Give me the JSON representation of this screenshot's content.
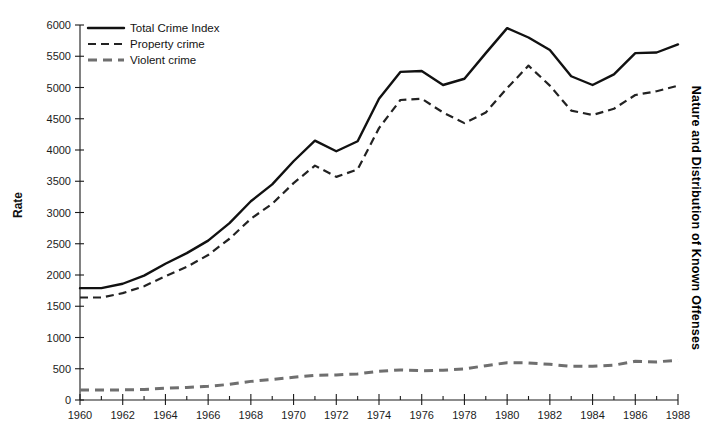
{
  "figure": {
    "side_title": "Nature and Distribution of Known Offenses",
    "cropped_top_title": ""
  },
  "chart_data": {
    "type": "line",
    "title": "",
    "xlabel": "",
    "ylabel": "Rate",
    "xlim": [
      1960,
      1988
    ],
    "ylim": [
      0,
      6000
    ],
    "y_ticks": [
      0,
      500,
      1000,
      1500,
      2000,
      2500,
      3000,
      3500,
      4000,
      4500,
      5000,
      5500,
      6000
    ],
    "y_tick_labels": [
      "0",
      "500",
      "1000",
      "1500",
      "2000",
      "2500",
      "3000",
      "3500",
      "4000",
      "4500",
      "5000",
      "5500",
      "6000"
    ],
    "x_ticks": [
      1960,
      1962,
      1964,
      1966,
      1968,
      1970,
      1972,
      1974,
      1976,
      1978,
      1980,
      1982,
      1984,
      1986,
      1988
    ],
    "x_tick_labels": [
      "1960",
      "1962",
      "1964",
      "1966",
      "1968",
      "1970",
      "1972",
      "1974",
      "1976",
      "1978",
      "1980",
      "1982",
      "1984",
      "1986",
      "1988"
    ],
    "x_minor_ticks": [
      1961,
      1963,
      1965,
      1967,
      1969,
      1971,
      1973,
      1975,
      1977,
      1979,
      1981,
      1983,
      1985,
      1987
    ],
    "grid": false,
    "legend_position": "top-left",
    "x": [
      1960,
      1961,
      1962,
      1963,
      1964,
      1965,
      1966,
      1967,
      1968,
      1969,
      1970,
      1971,
      1972,
      1973,
      1974,
      1975,
      1976,
      1977,
      1978,
      1979,
      1980,
      1981,
      1982,
      1983,
      1984,
      1985,
      1986,
      1987,
      1988
    ],
    "series": [
      {
        "name": "Total Crime Index",
        "style": "solid",
        "color": "#111111",
        "values": [
          1790,
          1790,
          1860,
          1990,
          2180,
          2350,
          2550,
          2830,
          3180,
          3450,
          3820,
          4150,
          3980,
          4140,
          4820,
          5250,
          5265,
          5040,
          5140,
          5550,
          5950,
          5800,
          5600,
          5180,
          5040,
          5210,
          5550,
          5560,
          5690
        ]
      },
      {
        "name": "Property crime",
        "style": "dashed",
        "color": "#222222",
        "values": [
          1640,
          1640,
          1710,
          1820,
          1980,
          2130,
          2320,
          2580,
          2900,
          3140,
          3470,
          3750,
          3570,
          3690,
          4350,
          4800,
          4820,
          4600,
          4430,
          4600,
          4990,
          5350,
          5030,
          4630,
          4560,
          4660,
          4880,
          4940,
          5030
        ]
      },
      {
        "name": "Violent crime",
        "style": "dashed-thick",
        "color": "#6f6f6f",
        "values": [
          160,
          160,
          162,
          168,
          190,
          200,
          220,
          250,
          298,
          328,
          364,
          396,
          401,
          417,
          461,
          482,
          468,
          476,
          498,
          549,
          597,
          594,
          571,
          538,
          539,
          557,
          620,
          610,
          637
        ]
      }
    ]
  },
  "legend": {
    "items": [
      {
        "label": "Total Crime Index",
        "style": "solid"
      },
      {
        "label": "Property crime",
        "style": "dashed"
      },
      {
        "label": "Violent crime",
        "style": "dashed-thick"
      }
    ]
  }
}
